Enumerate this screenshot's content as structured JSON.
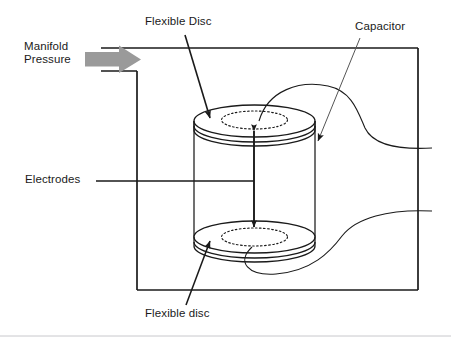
{
  "figure": {
    "type": "technical-diagram",
    "background_color": "#ffffff",
    "line_color": "#1a1a1a",
    "accent_color": "#9a9a9a",
    "footer_rule_color": "#c8c8cc"
  },
  "labels": {
    "manifold_pressure": "Manifold\nPressure",
    "flexible_disc_top": "Flexible Disc",
    "capacitor": "Capacitor",
    "electrodes": "Electrodes",
    "flexible_disc_bottom": "Flexible disc"
  },
  "icons": {
    "pressure_arrow": "right-block-arrow-icon",
    "flexible_disc_top_pointer": "arrow-pointer-icon",
    "flexible_disc_bottom_pointer": "arrow-pointer-icon",
    "capacitor_pointer": "arrow-pointer-icon",
    "gap_arrow": "double-headed-vertical-arrow-icon"
  },
  "parts": {
    "enclosure": "sensor-housing-outline",
    "cylinder": "capacitor-cylinder-body",
    "top_disc": "top-flexible-disc",
    "bottom_disc": "bottom-flexible-disc",
    "top_electrode_plate": "top-electrode-dotted-ellipse",
    "bottom_electrode_plate": "bottom-electrode-dotted-ellipse",
    "upper_lead": "upper-curved-lead-wire",
    "lower_lead": "lower-curved-lead-wire",
    "electrode_leader": "electrodes-leader-line",
    "gap_dimension": "electrode-gap-dimension-arrow"
  },
  "geometry": {
    "enclosure": {
      "left": 137,
      "top": 48,
      "right": 418,
      "bottom": 290,
      "inlet_top_y": 48,
      "inlet_bottom_y": 71,
      "inlet_left_x": 101
    },
    "cylinder": {
      "cx": 254.5,
      "left": 194,
      "right": 315,
      "rx": 60.5,
      "ry": 16,
      "top_cy": 121,
      "bottom_cy": 237,
      "disc_thickness": 9
    },
    "electrode_ellipse": {
      "rx": 33,
      "ry": 9
    },
    "gap_arrow": {
      "x": 254,
      "y_top": 125,
      "y_bottom": 233
    },
    "electrode_leader": {
      "x_start": 96,
      "x_end": 254,
      "y": 181
    },
    "footer_rule_y": 336
  }
}
